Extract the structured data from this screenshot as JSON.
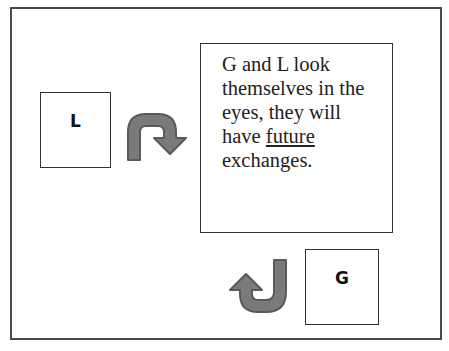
{
  "diagram": {
    "box_l": {
      "label": "L"
    },
    "box_g": {
      "label": "G"
    },
    "text_box": {
      "line1": "G and L look",
      "line2": "themselves in the",
      "line3": "eyes, they will",
      "line4_prefix": "have ",
      "line4_underlined": "future",
      "line5": "exchanges."
    },
    "arrows": [
      {
        "name": "curved-arrow-right-down",
        "from": "L",
        "direction": "clockwise-down"
      },
      {
        "name": "curved-arrow-left-up",
        "from": "G",
        "direction": "clockwise-up"
      }
    ],
    "colors": {
      "arrow_fill": "#7a7a7a",
      "arrow_stroke": "#5a5a5a",
      "border": "#333333",
      "text": "#222222"
    }
  }
}
